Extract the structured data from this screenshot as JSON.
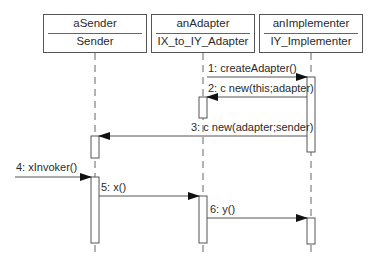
{
  "diagram": {
    "type": "UML sequence diagram",
    "objects": [
      {
        "name": "aSender",
        "class": "Sender"
      },
      {
        "name": "anAdapter",
        "class": "IX_to_IY_Adapter"
      },
      {
        "name": "anImplementer",
        "class": "IY_Implementer"
      }
    ],
    "messages": [
      {
        "label": "1: createAdapter()",
        "from": "anAdapter",
        "to": "anImplementer"
      },
      {
        "label": "2: c new(this;adapter)",
        "from": "anImplementer",
        "to": "anAdapter"
      },
      {
        "label": "3: c new(adapter;sender)",
        "from": "anImplementer",
        "to": "aSender"
      },
      {
        "label": "4: xInvoker()",
        "from": "external",
        "to": "aSender"
      },
      {
        "label": "5: x()",
        "from": "aSender",
        "to": "anAdapter"
      },
      {
        "label": "6: y()",
        "from": "anAdapter",
        "to": "anImplementer"
      }
    ],
    "colors": {
      "line": "#555555",
      "text": "#2a2a2a",
      "background": "#ffffff"
    }
  }
}
